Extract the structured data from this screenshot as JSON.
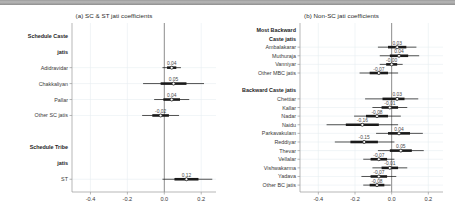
{
  "figure": {
    "top_bar": "document-edge-bar"
  },
  "panels": [
    {
      "id": "panel-a",
      "title": "(a) SC & ST jati coefficients",
      "xaxis": {
        "ticks": [
          "-0.4",
          "-0.2",
          "0.0",
          "0.2"
        ],
        "tickvals": [
          -0.4,
          -0.2,
          0.0,
          0.2
        ],
        "min": -0.5,
        "max": 0.28
      },
      "rows": [
        {
          "label": "Schedule Caste",
          "type": "group"
        },
        {
          "label": "jatis",
          "type": "group"
        },
        {
          "label": "Adidravidar",
          "type": "item",
          "value": 0.04,
          "value_label": "0.04",
          "lo95": -0.01,
          "hi95": 0.09,
          "lo50": 0.015,
          "hi50": 0.065
        },
        {
          "label": "Chakkaliyan",
          "type": "item",
          "value": 0.05,
          "value_label": "0.05",
          "lo95": -0.115,
          "hi95": 0.215,
          "lo50": -0.02,
          "hi50": 0.12
        },
        {
          "label": "Pallar",
          "type": "item",
          "value": 0.04,
          "value_label": "0.04",
          "lo95": -0.055,
          "hi95": 0.135,
          "lo50": -0.005,
          "hi50": 0.085
        },
        {
          "label": "Other SC jatis",
          "type": "item",
          "value": -0.02,
          "value_label": "-0.02",
          "lo95": -0.12,
          "hi95": 0.08,
          "lo50": -0.065,
          "hi50": 0.025
        },
        {
          "label": "",
          "type": "spacer"
        },
        {
          "label": "Schedule Tribe",
          "type": "group"
        },
        {
          "label": "jatis",
          "type": "group"
        },
        {
          "label": "ST",
          "type": "item",
          "value": 0.12,
          "value_label": "0.12",
          "lo95": -0.01,
          "hi95": 0.26,
          "lo50": 0.055,
          "hi50": 0.185
        }
      ]
    },
    {
      "id": "panel-b",
      "title": "(b) Non-SC jati coefficients",
      "xaxis": {
        "ticks": [
          "-0.4",
          "-0.2",
          "0.0",
          "0.2"
        ],
        "tickvals": [
          -0.4,
          -0.2,
          0.0,
          0.2
        ],
        "min": -0.5,
        "max": 0.28
      },
      "rows": [
        {
          "label": "Most Backward",
          "type": "group"
        },
        {
          "label": "Caste jatis",
          "type": "group"
        },
        {
          "label": "Ambalakarar",
          "type": "item",
          "value": 0.03,
          "value_label": "0.03",
          "lo95": -0.075,
          "hi95": 0.135,
          "lo50": -0.02,
          "hi50": 0.08
        },
        {
          "label": "Muthuraja",
          "type": "item",
          "value": 0.04,
          "value_label": "0.04",
          "lo95": -0.065,
          "hi95": 0.15,
          "lo50": -0.01,
          "hi50": 0.09
        },
        {
          "label": "Vanniyar",
          "type": "item",
          "value": -0.0,
          "value_label": "-0.00",
          "lo95": -0.065,
          "hi95": 0.06,
          "lo50": -0.03,
          "hi50": 0.03
        },
        {
          "label": "Other MBC jatis",
          "type": "item",
          "value": -0.07,
          "value_label": "-0.07",
          "lo95": -0.175,
          "hi95": 0.035,
          "lo50": -0.12,
          "hi50": -0.02
        },
        {
          "label": "",
          "type": "spacer"
        },
        {
          "label": "Backward Caste jatis",
          "type": "group"
        },
        {
          "label": "Chettiar",
          "type": "item",
          "value": 0.03,
          "value_label": "0.03",
          "lo95": -0.145,
          "hi95": 0.145,
          "lo50": -0.05,
          "hi50": 0.07
        },
        {
          "label": "Kallar",
          "type": "item",
          "value": -0.01,
          "value_label": "-0.01",
          "lo95": -0.105,
          "hi95": 0.085,
          "lo50": -0.055,
          "hi50": 0.035
        },
        {
          "label": "Nadar",
          "type": "item",
          "value": -0.08,
          "value_label": "-0.08",
          "lo95": -0.205,
          "hi95": 0.05,
          "lo50": -0.14,
          "hi50": -0.02
        },
        {
          "label": "Naidu",
          "type": "item",
          "value": -0.16,
          "value_label": "-0.16",
          "lo95": -0.355,
          "hi95": 0.035,
          "lo50": -0.25,
          "hi50": -0.07
        },
        {
          "label": "Parkavakulam",
          "type": "item",
          "value": 0.04,
          "value_label": "0.04",
          "lo95": -0.085,
          "hi95": 0.17,
          "lo50": -0.02,
          "hi50": 0.1
        },
        {
          "label": "Reddiyar",
          "type": "item",
          "value": -0.15,
          "value_label": "-0.15",
          "lo95": -0.31,
          "hi95": 0.015,
          "lo50": -0.225,
          "hi50": -0.075
        },
        {
          "label": "Thevar",
          "type": "item",
          "value": 0.05,
          "value_label": "0.05",
          "lo95": -0.075,
          "hi95": 0.175,
          "lo50": -0.01,
          "hi50": 0.11
        },
        {
          "label": "Vellalar",
          "type": "item",
          "value": -0.07,
          "value_label": "-0.07",
          "lo95": -0.155,
          "hi95": 0.015,
          "lo50": -0.115,
          "hi50": -0.025
        },
        {
          "label": "Vishwakarma",
          "type": "item",
          "value": -0.01,
          "value_label": "-0.01",
          "lo95": -0.105,
          "hi95": 0.085,
          "lo50": -0.055,
          "hi50": 0.035
        },
        {
          "label": "Yadava",
          "type": "item",
          "value": -0.07,
          "value_label": "-0.07",
          "lo95": -0.165,
          "hi95": 0.025,
          "lo50": -0.115,
          "hi50": -0.025
        },
        {
          "label": "Other BC jatis",
          "type": "item",
          "value": -0.08,
          "value_label": "-0.08",
          "lo95": -0.155,
          "hi95": -0.005,
          "lo50": -0.12,
          "hi50": -0.04
        }
      ]
    }
  ],
  "chart_data": {
    "type": "scatter",
    "xlabel": "",
    "ylabel": "",
    "xlim": [
      -0.5,
      0.28
    ],
    "grid": true,
    "legend": "none",
    "panels": [
      {
        "title": "(a) SC & ST jati coefficients",
        "xticks": [
          -0.4,
          -0.2,
          0.0,
          0.2
        ],
        "xticklabels": [
          "-0.4",
          "-0.2",
          "0.0",
          "0.2"
        ],
        "groups": [
          {
            "name": "Schedule Caste jatis",
            "points": [
              {
                "label": "Adidravidar",
                "value": 0.04,
                "ci95": [
                  -0.01,
                  0.09
                ],
                "ci50": [
                  0.015,
                  0.065
                ]
              },
              {
                "label": "Chakkaliyan",
                "value": 0.05,
                "ci95": [
                  -0.115,
                  0.215
                ],
                "ci50": [
                  -0.02,
                  0.12
                ]
              },
              {
                "label": "Pallar",
                "value": 0.04,
                "ci95": [
                  -0.055,
                  0.135
                ],
                "ci50": [
                  -0.005,
                  0.085
                ]
              },
              {
                "label": "Other SC jatis",
                "value": -0.02,
                "ci95": [
                  -0.12,
                  0.08
                ],
                "ci50": [
                  -0.065,
                  0.025
                ]
              }
            ]
          },
          {
            "name": "Schedule Tribe jatis",
            "points": [
              {
                "label": "ST",
                "value": 0.12,
                "ci95": [
                  -0.01,
                  0.26
                ],
                "ci50": [
                  0.055,
                  0.185
                ]
              }
            ]
          }
        ]
      },
      {
        "title": "(b) Non-SC jati coefficients",
        "xticks": [
          -0.4,
          -0.2,
          0.0,
          0.2
        ],
        "xticklabels": [
          "-0.4",
          "-0.2",
          "0.0",
          "0.2"
        ],
        "groups": [
          {
            "name": "Most Backward Caste jatis",
            "points": [
              {
                "label": "Ambalakarar",
                "value": 0.03,
                "ci95": [
                  -0.075,
                  0.135
                ],
                "ci50": [
                  -0.02,
                  0.08
                ]
              },
              {
                "label": "Muthuraja",
                "value": 0.04,
                "ci95": [
                  -0.065,
                  0.15
                ],
                "ci50": [
                  -0.01,
                  0.09
                ]
              },
              {
                "label": "Vanniyar",
                "value": -0.0,
                "ci95": [
                  -0.065,
                  0.06
                ],
                "ci50": [
                  -0.03,
                  0.03
                ]
              },
              {
                "label": "Other MBC jatis",
                "value": -0.07,
                "ci95": [
                  -0.175,
                  0.035
                ],
                "ci50": [
                  -0.12,
                  -0.02
                ]
              }
            ]
          },
          {
            "name": "Backward Caste jatis",
            "points": [
              {
                "label": "Chettiar",
                "value": 0.03,
                "ci95": [
                  -0.145,
                  0.145
                ],
                "ci50": [
                  -0.05,
                  0.07
                ]
              },
              {
                "label": "Kallar",
                "value": -0.01,
                "ci95": [
                  -0.105,
                  0.085
                ],
                "ci50": [
                  -0.055,
                  0.035
                ]
              },
              {
                "label": "Nadar",
                "value": -0.08,
                "ci95": [
                  -0.205,
                  0.05
                ],
                "ci50": [
                  -0.14,
                  -0.02
                ]
              },
              {
                "label": "Naidu",
                "value": -0.16,
                "ci95": [
                  -0.355,
                  0.035
                ],
                "ci50": [
                  -0.25,
                  -0.07
                ]
              },
              {
                "label": "Parkavakulam",
                "value": 0.04,
                "ci95": [
                  -0.085,
                  0.17
                ],
                "ci50": [
                  -0.02,
                  0.1
                ]
              },
              {
                "label": "Reddiyar",
                "value": -0.15,
                "ci95": [
                  -0.31,
                  0.015
                ],
                "ci50": [
                  -0.225,
                  -0.075
                ]
              },
              {
                "label": "Thevar",
                "value": 0.05,
                "ci95": [
                  -0.075,
                  0.175
                ],
                "ci50": [
                  -0.01,
                  0.11
                ]
              },
              {
                "label": "Vellalar",
                "value": -0.07,
                "ci95": [
                  -0.155,
                  0.015
                ],
                "ci50": [
                  -0.115,
                  -0.025
                ]
              },
              {
                "label": "Vishwakarma",
                "value": -0.01,
                "ci95": [
                  -0.105,
                  0.085
                ],
                "ci50": [
                  -0.055,
                  0.035
                ]
              },
              {
                "label": "Yadava",
                "value": -0.07,
                "ci95": [
                  -0.165,
                  0.025
                ],
                "ci50": [
                  -0.115,
                  -0.025
                ]
              },
              {
                "label": "Other BC jatis",
                "value": -0.08,
                "ci95": [
                  -0.155,
                  -0.005
                ],
                "ci50": [
                  -0.12,
                  -0.04
                ]
              }
            ]
          }
        ]
      }
    ]
  }
}
